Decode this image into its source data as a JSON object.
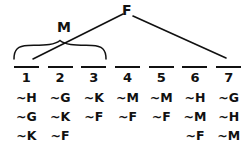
{
  "figure": {
    "type": "truth-tree-diagram",
    "ink_color": "#111111",
    "background_color": "#ffffff",
    "nodes": [
      {
        "id": "M",
        "label": "M"
      },
      {
        "id": "F",
        "label": "F"
      }
    ],
    "brace": {
      "name": "grouping-brace",
      "spans_columns": [
        1,
        2,
        3
      ]
    },
    "branches": [
      {
        "name": "left-branch",
        "from": "F",
        "to": "M-group"
      },
      {
        "name": "right-branch",
        "from": "F",
        "to": "right-group"
      }
    ]
  },
  "table": {
    "column_numbers": [
      "1",
      "2",
      "3",
      "4",
      "5",
      "6",
      "7"
    ],
    "columns": [
      {
        "number": "1",
        "cells": [
          "~H",
          "~G",
          "~K"
        ]
      },
      {
        "number": "2",
        "cells": [
          "~G",
          "~K",
          "~F"
        ]
      },
      {
        "number": "3",
        "cells": [
          "~K",
          "~F",
          ""
        ]
      },
      {
        "number": "4",
        "cells": [
          "~M",
          "~F",
          ""
        ]
      },
      {
        "number": "5",
        "cells": [
          "~M",
          "~F",
          ""
        ]
      },
      {
        "number": "6",
        "cells": [
          "~H",
          "~M",
          "~F"
        ]
      },
      {
        "number": "7",
        "cells": [
          "~G",
          "~H",
          "~M"
        ]
      }
    ]
  }
}
